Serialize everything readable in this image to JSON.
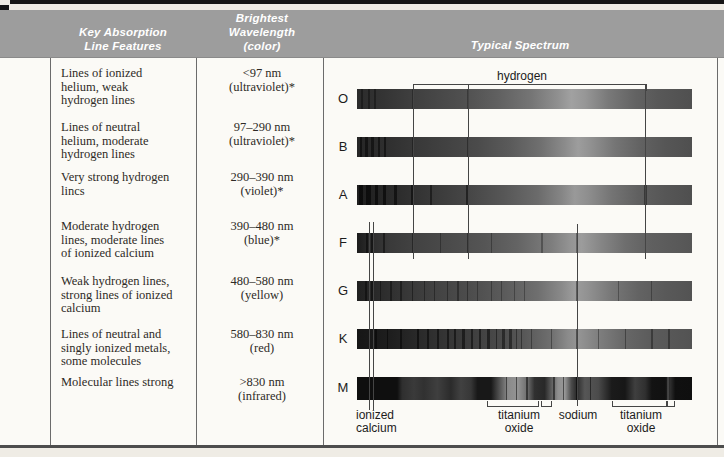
{
  "table": {
    "headers": {
      "features": "Key Absorption Line Features",
      "wavelength": "Brightest Wavelength (color)",
      "spectrum": "Typical Spectrum"
    },
    "rows": [
      {
        "type": "O",
        "features": "Lines of ionized helium, weak hydrogen lines",
        "wavelength": "<97 nm",
        "color": "(ultraviolet)*"
      },
      {
        "type": "B",
        "features": "Lines of neutral helium, moderate hydrogen lines",
        "wavelength": "97–290 nm",
        "color": "(ultraviolet)*"
      },
      {
        "type": "A",
        "features": "Very strong hydrogen lincs",
        "wavelength": "290–390 nm",
        "color": "(violet)*"
      },
      {
        "type": "F",
        "features": "Moderate hydrogen lines, moderate lines of ionized calcium",
        "wavelength": "390–480 nm",
        "color": "(blue)*"
      },
      {
        "type": "G",
        "features": "Weak hydrogen lines, strong lines of ionized calcium",
        "wavelength": "480–580 nm",
        "color": "(yellow)"
      },
      {
        "type": "K",
        "features": "Lines of neutral and singly ionized metals, some molecules",
        "wavelength": "580–830 nm",
        "color": "(red)"
      },
      {
        "type": "M",
        "features": "Molecular lines strong",
        "wavelength": ">830 nm",
        "color": "(infrared)"
      }
    ]
  },
  "annotations": {
    "hydrogen": "hydrogen",
    "ionized_calcium": "ionized calcium",
    "titanium_oxide_1": "titanium oxide",
    "sodium": "sodium",
    "titanium_oxide_2": "titanium oxide"
  },
  "colors": {
    "header_band": "#9d9d9d",
    "header_text": "#ffffff",
    "body_text": "#2e2a26",
    "rule": "#4d4d4d",
    "page_background": "#efece5",
    "table_background": "#fbfaf6"
  }
}
